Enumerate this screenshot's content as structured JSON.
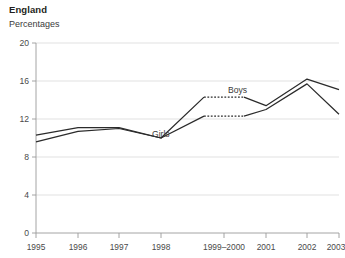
{
  "chart_data": {
    "type": "line",
    "title": "England",
    "subtitle": "Percentages",
    "xlabel": "",
    "ylabel": "Percentages",
    "ylim": [
      0,
      20
    ],
    "yticks": [
      0,
      4,
      8,
      12,
      16,
      20
    ],
    "ytick_labels": [
      "0",
      "4",
      "8",
      "12",
      "16",
      "20"
    ],
    "grid": true,
    "grid_axis": "y",
    "legend": "inline-annotations",
    "categories": [
      "1995",
      "1996",
      "1997",
      "1998",
      "1999–2000",
      "2001",
      "2002",
      "2003"
    ],
    "series": [
      {
        "name": "Boys",
        "values": [
          10.3,
          11.1,
          11.1,
          10.0,
          14.3,
          13.4,
          16.2,
          15.1
        ],
        "dashed_segment": {
          "from": "1999–2000",
          "to": "1999–2000",
          "note": "flat dashed segment spanning the 1999–2000 combined period"
        }
      },
      {
        "name": "Girls",
        "values": [
          9.6,
          10.7,
          11.0,
          10.0,
          12.3,
          13.0,
          15.7,
          12.5
        ],
        "dashed_segment": {
          "from": "1999–2000",
          "to": "1999–2000",
          "note": "flat dashed segment spanning the 1999–2000 combined period"
        }
      }
    ],
    "annotations": [
      {
        "text": "Boys",
        "x": "between 1999–2000 and 2001",
        "y": 14.3
      },
      {
        "text": "Girls",
        "x": "between 1998 and 1999–2000",
        "y": 11.2
      }
    ],
    "colors": {
      "line": "#2b2b2b",
      "grid": "#d9d9d9",
      "axis": "#9a9a9a",
      "text": "#231f20",
      "background": "#ffffff"
    }
  },
  "axes": {
    "y_tick_labels": [
      "20",
      "16",
      "12",
      "8",
      "4",
      "0"
    ],
    "x_tick_labels": [
      "1995",
      "1996",
      "1997",
      "1998",
      "1999–2000",
      "2001",
      "2002",
      "2003"
    ]
  },
  "labels": {
    "boys": "Boys",
    "girls": "Girls"
  }
}
